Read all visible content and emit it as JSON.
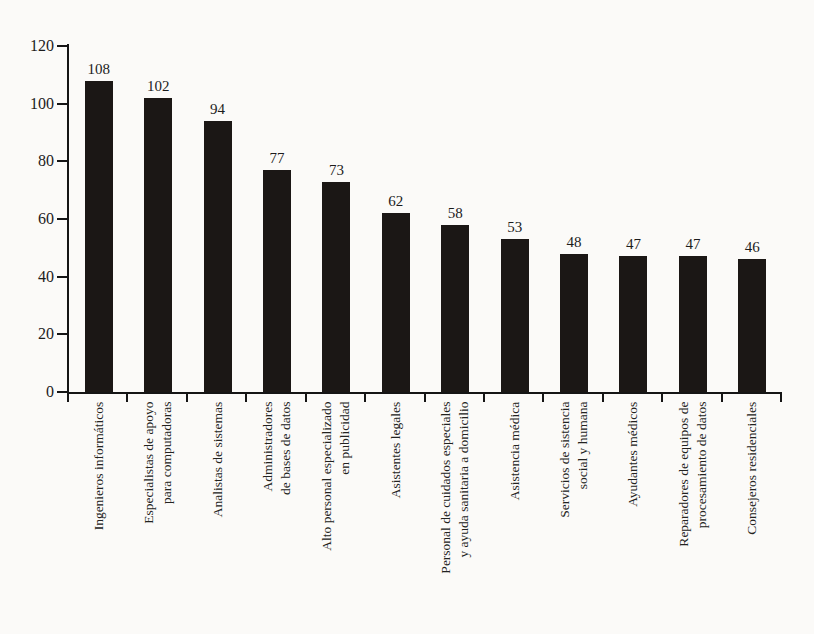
{
  "page": {
    "background_color": "#fbfaf8",
    "title": ""
  },
  "chart_data": {
    "type": "bar",
    "title": "",
    "xlabel": "",
    "ylabel": "",
    "categories": [
      [
        "Ingenieros informáticos"
      ],
      [
        "Especialistas de apoyo",
        "para computadoras"
      ],
      [
        "Analistas de sistemas"
      ],
      [
        "Administradores",
        "de bases de datos"
      ],
      [
        "Alto personal especializado",
        "en publicidad"
      ],
      [
        "Asistentes legales"
      ],
      [
        "Personal de cuidados especiales",
        "y ayuda sanitaria a domicilio"
      ],
      [
        "Asistencia médica"
      ],
      [
        "Servicios de sistencia",
        "social y humana"
      ],
      [
        "Ayudantes médicos"
      ],
      [
        "Reparadores de equipos de",
        "procesamiento de datos"
      ],
      [
        "Consejeros residenciales"
      ]
    ],
    "values": [
      108,
      102,
      94,
      77,
      73,
      62,
      58,
      53,
      48,
      47,
      47,
      46
    ],
    "value_labels": [
      "108",
      "102",
      "94",
      "77",
      "73",
      "62",
      "58",
      "53",
      "48",
      "47",
      "47",
      "46"
    ],
    "ylim": [
      0,
      120
    ],
    "yticks": [
      0,
      20,
      40,
      60,
      80,
      100,
      120
    ],
    "ytick_labels": [
      "0",
      "20",
      "40",
      "60",
      "80",
      "100",
      "120"
    ],
    "grid": false,
    "legend": null,
    "bar_color": "#1b1715",
    "axis_color": "#151515",
    "text_color": "#1c1c1c",
    "x_labels_rotation_deg": 90
  }
}
